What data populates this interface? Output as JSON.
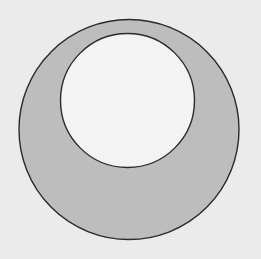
{
  "diagram": {
    "type": "annulus-offset-circles",
    "background_color": "#ebebeb",
    "outer_circle": {
      "cx": 129,
      "cy": 129.5,
      "r": 110,
      "fill": "#bdbdbd",
      "stroke": "#2a2a2a"
    },
    "inner_circle": {
      "cx": 127.5,
      "cy": 100.5,
      "r": 67,
      "fill": "#f3f3f3",
      "stroke": "#2a2a2a"
    }
  }
}
